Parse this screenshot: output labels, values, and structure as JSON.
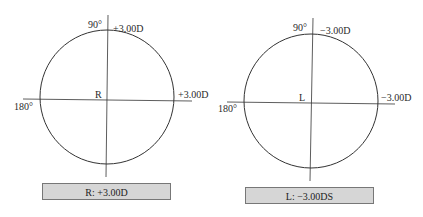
{
  "figures": [
    {
      "eye": "right",
      "center_label": "R",
      "axis_90_label": "90°",
      "axis_180_label": "180°",
      "vertical_power": "+3.00D",
      "horizontal_power": "+3.00D",
      "summary": "R: +3.00D"
    },
    {
      "eye": "left",
      "center_label": "L",
      "axis_90_label": "90°",
      "axis_180_label": "180°",
      "vertical_power": "−3.00D",
      "horizontal_power": "−3.00D",
      "summary": "L: −3.00DS"
    }
  ],
  "colors": {
    "line": "#333333",
    "box_fill": "#d6d6d6",
    "box_border": "#777777"
  }
}
